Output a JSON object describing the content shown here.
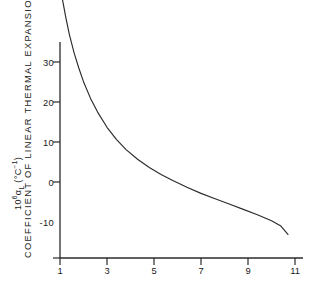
{
  "chart_data": {
    "type": "line",
    "title": "",
    "xlabel": "DRAW  RATIO",
    "ylabel": "COEFFICIENT  OF  LINEAR  THERMAL  EXPANSION   ( x10⁶)",
    "ylabel_symbol_prefix": "10",
    "ylabel_symbol_sup": "6",
    "ylabel_symbol_alpha": "α",
    "ylabel_symbol_sub": "L",
    "ylabel_symbol_units": " (°C",
    "ylabel_symbol_units_sup": "−1",
    "ylabel_symbol_units_close": ")",
    "xlim": [
      1,
      11
    ],
    "ylim": [
      -10,
      34
    ],
    "xticks": [
      1,
      3,
      5,
      7,
      9,
      11
    ],
    "xtick_labels": [
      "1",
      "3",
      "5",
      "7",
      "9",
      "11"
    ],
    "yticks": [
      30,
      20,
      10,
      0,
      -10
    ],
    "ytick_labels": [
      "30",
      "20",
      "10",
      "0",
      "-10"
    ],
    "grid": false,
    "legend": null,
    "line_color": "#2b2b2b",
    "axis_color": "#2b2b2b",
    "background": "#ffffff",
    "series": [
      {
        "name": "linear thermal expansion vs draw ratio",
        "x": [
          1.0,
          1.1,
          1.25,
          1.4,
          1.6,
          1.8,
          2.0,
          2.3,
          2.6,
          3.0,
          3.4,
          3.8,
          4.3,
          4.8,
          5.3,
          5.8,
          6.4,
          7.0,
          7.6,
          8.2,
          8.8,
          9.4,
          10.0,
          10.4,
          10.7
        ],
        "values": [
          26.0,
          24.1,
          21.6,
          19.4,
          17.0,
          15.0,
          13.2,
          11.0,
          9.2,
          7.2,
          5.6,
          4.3,
          3.0,
          1.9,
          1.0,
          0.2,
          -0.7,
          -1.5,
          -2.2,
          -2.9,
          -3.6,
          -4.3,
          -5.1,
          -5.8,
          -6.9
        ]
      }
    ]
  }
}
